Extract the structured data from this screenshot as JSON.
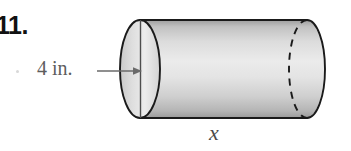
{
  "figure": {
    "problem_number": "11.",
    "diameter_label": "4 in.",
    "length_label": "x",
    "shape": "cylinder",
    "colors": {
      "number_text": "#111111",
      "label_text": "#5d5d5d",
      "length_text": "#4a4a4a",
      "outline": "#1a1a1a",
      "body_light": "#e8e8e8",
      "body_mid": "#d0d0d0",
      "body_dark": "#a8a8a8",
      "cap_light": "#ececec",
      "cap_dark": "#b4b4b4",
      "arrow": "#6a6a6a",
      "background": "#ffffff"
    },
    "icons": {
      "dimension_arrow": "arrow-right-icon",
      "hidden_edge": "dashed-ellipse-icon"
    }
  }
}
